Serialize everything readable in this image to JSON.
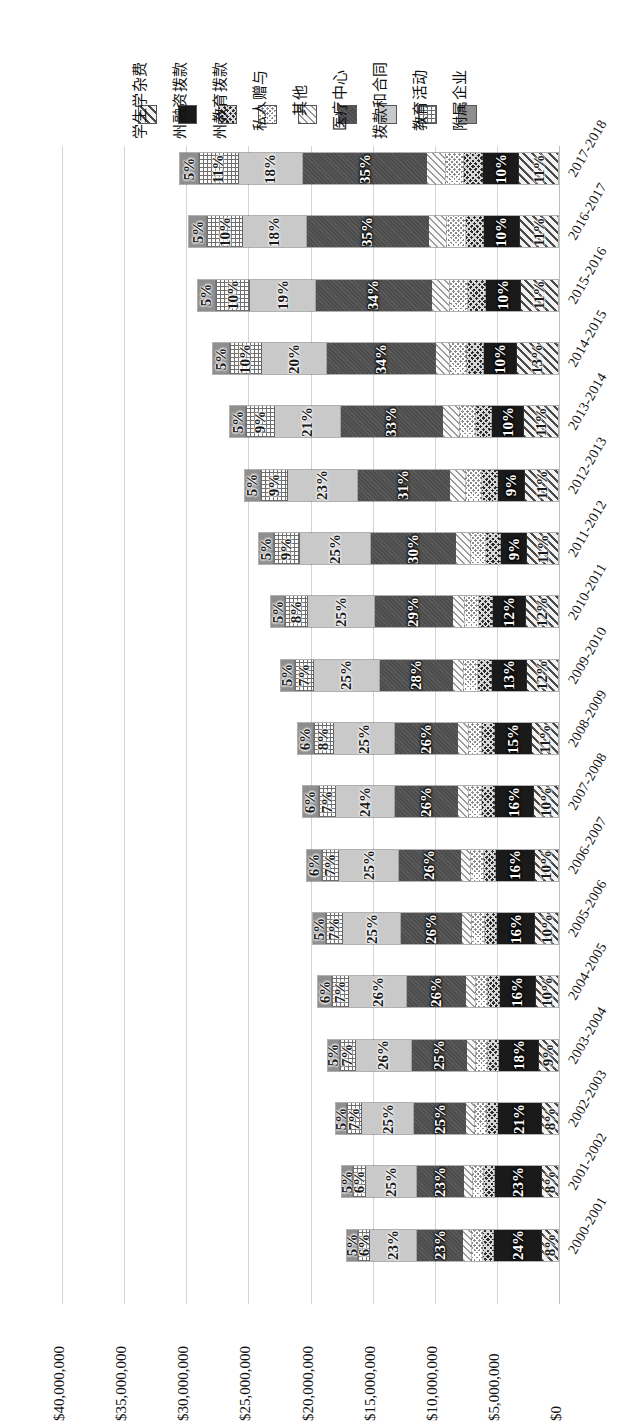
{
  "legend": {
    "items": [
      {
        "label": "学生学杂费",
        "pattern": "p-diag-hatch",
        "dark": false
      },
      {
        "label": "州融资拨款",
        "pattern": "p-solid-black",
        "dark": true
      },
      {
        "label": "州教育拨款",
        "pattern": "p-dark-check",
        "dark": true
      },
      {
        "label": "私人赠与",
        "pattern": "p-fine-check",
        "dark": false
      },
      {
        "label": "其他",
        "pattern": "p-light-diag",
        "dark": false
      },
      {
        "label": "医疗中心",
        "pattern": "p-dark-gray",
        "dark": true
      },
      {
        "label": "拨款和合同",
        "pattern": "p-light-gray",
        "dark": false
      },
      {
        "label": "教育活动",
        "pattern": "p-dot-grid",
        "dark": false
      },
      {
        "label": "附属企业",
        "pattern": "p-med-gray",
        "dark": false
      }
    ]
  },
  "axis": {
    "ticks": [
      "$40,000,000",
      "$35,000,000",
      "$30,000,000",
      "$25,000,000",
      "$20,000,000",
      "$15,000,000",
      "$10,000,000",
      "$5,000,000",
      "$0"
    ],
    "tick_values": [
      40000000,
      35000000,
      30000000,
      25000000,
      20000000,
      15000000,
      10000000,
      5000000,
      0
    ]
  },
  "chart_data": {
    "type": "bar",
    "orientation": "horizontal-stacked",
    "title": "",
    "xlabel": "",
    "ylabel": "",
    "ylim": [
      0,
      40000000
    ],
    "grid": true,
    "legend_position": "top",
    "note": "Stacked bars run right-to-left from $0; value axis is reversed.",
    "categories": [
      "2017-2018",
      "2016-2017",
      "2015-2016",
      "2014-2015",
      "2013-2014",
      "2012-2013",
      "2011-2012",
      "2010-2011",
      "2009-2010",
      "2008-2009",
      "2007-2008",
      "2006-2007",
      "2005-2006",
      "2004-2005",
      "2003-2004",
      "2002-2003",
      "2001-2002",
      "2000-2001"
    ],
    "series": [
      {
        "name": "学生学杂费",
        "pattern": "p-diag-hatch",
        "dark": false,
        "values": [
          11,
          11,
          11,
          13,
          11,
          11,
          11,
          12,
          12,
          11,
          10,
          10,
          10,
          10,
          9,
          8,
          8,
          8
        ]
      },
      {
        "name": "州融资拨款",
        "pattern": "p-solid-black",
        "dark": true,
        "values": [
          10,
          10,
          10,
          10,
          10,
          9,
          9,
          12,
          13,
          15,
          16,
          16,
          16,
          16,
          18,
          21,
          23,
          24
        ]
      },
      {
        "name": "州教育拨款",
        "pattern": "p-dark-check",
        "dark": true,
        "values": [
          5,
          5,
          5,
          5,
          5,
          5,
          5,
          5,
          5,
          5,
          5,
          5,
          5,
          5,
          5,
          5,
          5,
          5
        ]
      },
      {
        "name": "私人赠与",
        "pattern": "p-fine-check",
        "dark": false,
        "values": [
          5,
          5,
          5,
          5,
          5,
          5,
          5,
          5,
          5,
          5,
          5,
          5,
          5,
          5,
          5,
          5,
          5,
          5
        ]
      },
      {
        "name": "其他",
        "pattern": "p-light-diag",
        "dark": false,
        "values": [
          5,
          5,
          5,
          4,
          5,
          5,
          5,
          4,
          4,
          4,
          4,
          4,
          4,
          4,
          4,
          4,
          4,
          4
        ]
      },
      {
        "name": "医疗中心",
        "pattern": "p-dark-gray",
        "dark": true,
        "values": [
          35,
          35,
          34,
          34,
          33,
          31,
          30,
          29,
          28,
          26,
          26,
          26,
          26,
          26,
          25,
          25,
          23,
          23
        ]
      },
      {
        "name": "拨款和合同",
        "pattern": "p-light-gray",
        "dark": false,
        "values": [
          18,
          18,
          19,
          20,
          21,
          23,
          25,
          25,
          25,
          25,
          24,
          25,
          25,
          26,
          26,
          25,
          25,
          23
        ]
      },
      {
        "name": "教育活动",
        "pattern": "p-dot-grid",
        "dark": false,
        "values": [
          11,
          10,
          10,
          10,
          9,
          9,
          9,
          8,
          7,
          8,
          7,
          7,
          7,
          7,
          7,
          7,
          6,
          6
        ]
      },
      {
        "name": "附属企业",
        "pattern": "p-med-gray",
        "dark": false,
        "values": [
          5,
          5,
          5,
          5,
          5,
          5,
          5,
          5,
          5,
          6,
          6,
          6,
          5,
          6,
          5,
          5,
          5,
          5
        ]
      }
    ],
    "labeled_series_indices": [
      0,
      1,
      5,
      6,
      7,
      8
    ],
    "bar_totals": [
      30400000,
      29700000,
      29000000,
      27800000,
      26400000,
      25200000,
      24100000,
      23100000,
      22300000,
      20900000,
      20500000,
      20200000,
      19700000,
      19300000,
      18500000,
      17900000,
      17400000,
      17000000
    ]
  }
}
